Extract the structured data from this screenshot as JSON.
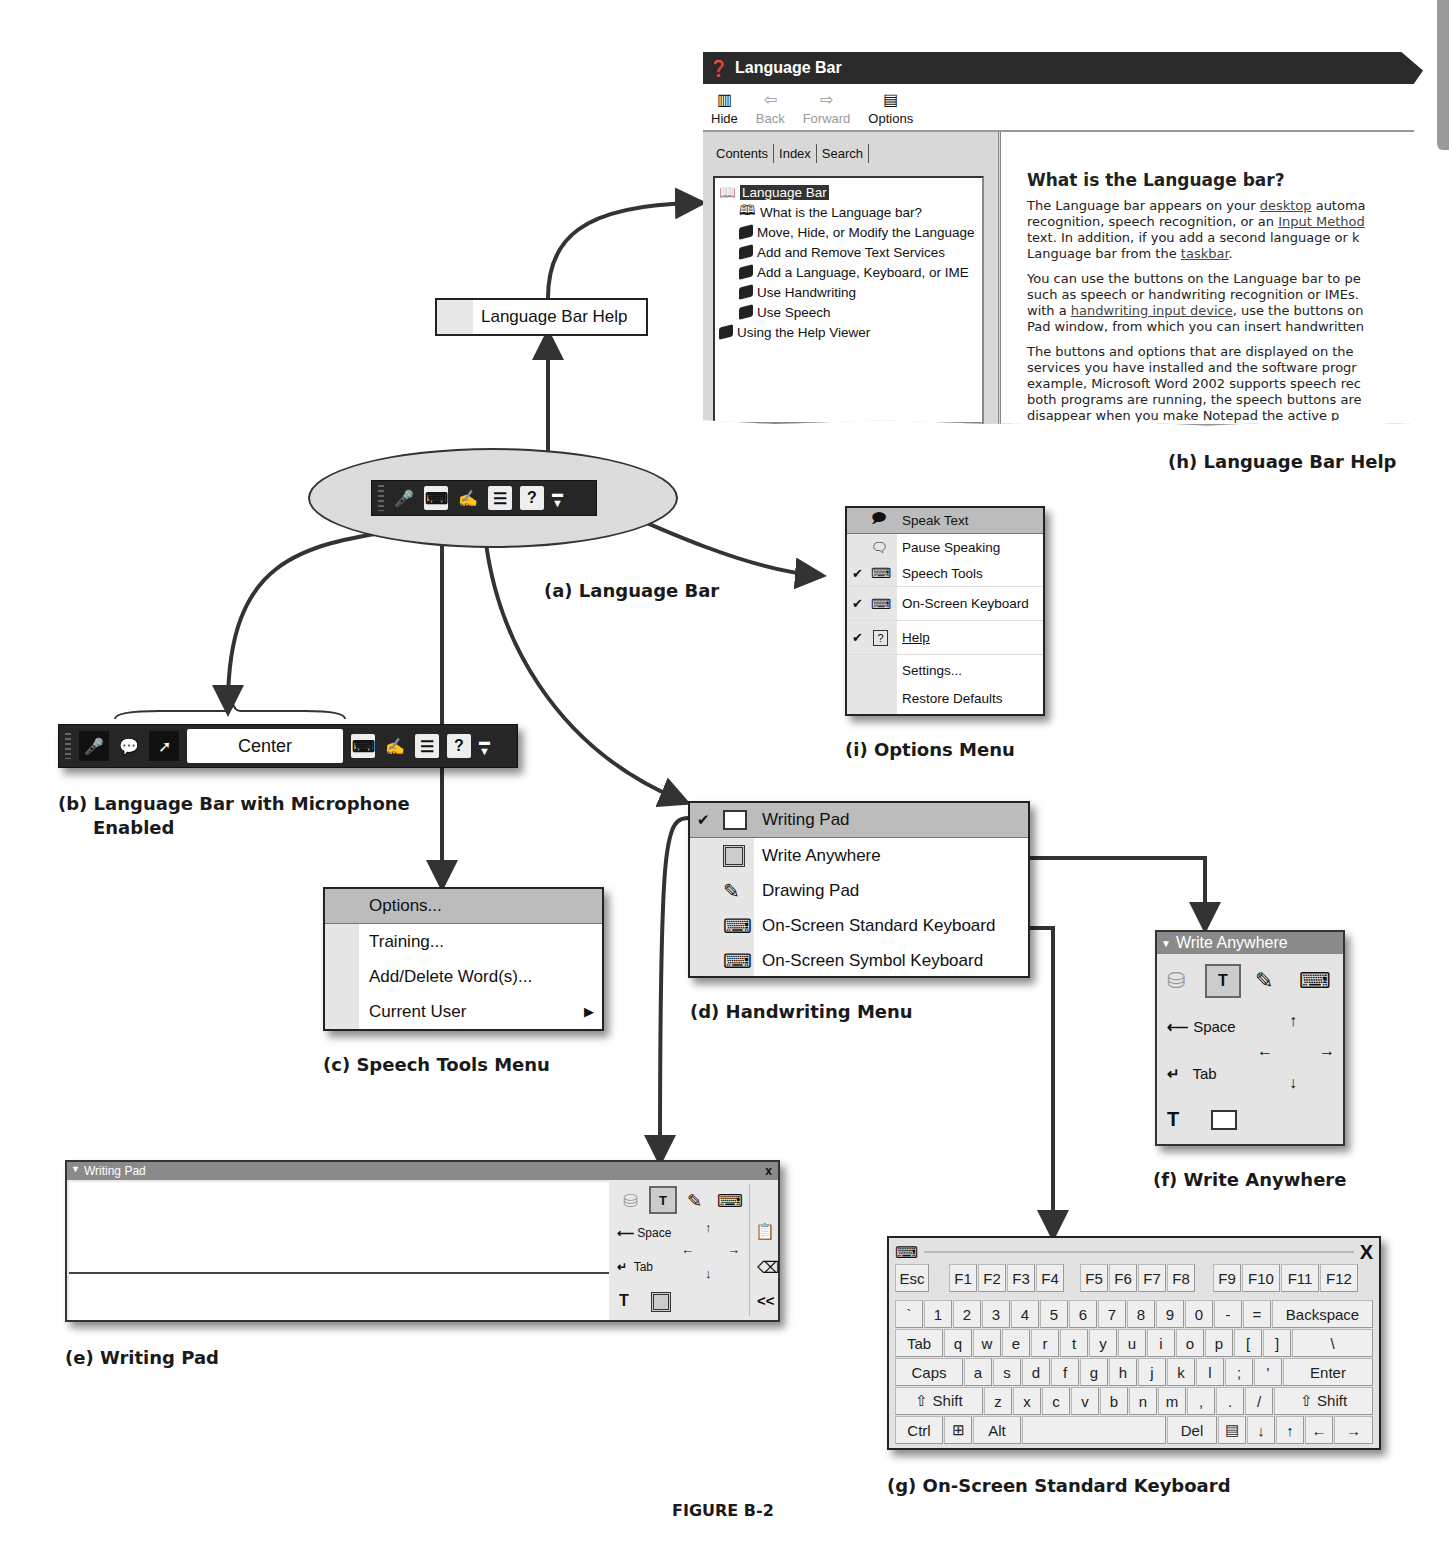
{
  "figure_label": "FIGURE B-2",
  "captions": {
    "a": "(a) Language Bar",
    "b_line1": "(b) Language Bar with Microphone",
    "b_line2": "Enabled",
    "c": "(c) Speech Tools Menu",
    "d": "(d) Handwriting Menu",
    "e": "(e) Writing Pad",
    "f": "(f) Write Anywhere",
    "g": "(g) On-Screen Standard Keyboard",
    "h": "(h) Language Bar Help",
    "i": "(i) Options Menu"
  },
  "help_window": {
    "title": "Language Bar",
    "toolbar": [
      {
        "label": "Hide",
        "icon": "hide-icon",
        "enabled": true
      },
      {
        "label": "Back",
        "icon": "back-arrow-icon",
        "enabled": false
      },
      {
        "label": "Forward",
        "icon": "forward-arrow-icon",
        "enabled": false
      },
      {
        "label": "Options",
        "icon": "options-icon",
        "enabled": true
      }
    ],
    "tabs": [
      "Contents",
      "Index",
      "Search"
    ],
    "tree": [
      {
        "label": "Language Bar",
        "level": 0,
        "selected": true,
        "icon": "open-book-icon"
      },
      {
        "label": "What is the Language bar?",
        "level": 1,
        "icon": "help-page-icon"
      },
      {
        "label": "Move, Hide, or Modify the Language",
        "level": 1,
        "icon": "book-icon"
      },
      {
        "label": "Add and Remove Text Services",
        "level": 1,
        "icon": "book-icon"
      },
      {
        "label": "Add a Language, Keyboard, or IME",
        "level": 1,
        "icon": "book-icon"
      },
      {
        "label": "Use Handwriting",
        "level": 1,
        "icon": "book-icon"
      },
      {
        "label": "Use Speech",
        "level": 1,
        "icon": "book-icon"
      },
      {
        "label": "Using the Help Viewer",
        "level": 0,
        "icon": "book-icon"
      }
    ],
    "content": {
      "heading": "What is the Language bar?",
      "p1": [
        "The Language bar appears on your ",
        "desktop",
        " automa",
        "recognition, speech recognition, or an ",
        "Input Method",
        "text. In addition, if you add a second language or k",
        "Language bar from the ",
        "taskbar",
        "."
      ],
      "p2": [
        "You can use the buttons on the Language bar to pe",
        "such as speech or handwriting recognition or IMEs.",
        "with a ",
        "handwriting input device",
        ", use the buttons on",
        "Pad window, from which you can insert handwritten"
      ],
      "p3": [
        "The buttons and options that are displayed on the",
        "services you have installed and the software progr",
        "example, Microsoft Word 2002 supports speech rec",
        "both programs are running, the speech buttons are",
        "disappear when you make Notepad the active p"
      ]
    }
  },
  "language_bar_help_item": "Language Bar Help",
  "language_bar": {
    "icons": [
      "microphone-icon",
      "speech-tools-icon",
      "handwriting-icon",
      "writing-pad-icon",
      "help-icon",
      "minimize-icon"
    ]
  },
  "language_bar_mic": {
    "status_text": "Center",
    "icons": [
      "microphone-icon",
      "dictation-icon",
      "voice-command-icon",
      "speech-tools-icon",
      "handwriting-icon",
      "writing-pad-icon",
      "help-icon",
      "minimize-icon"
    ]
  },
  "options_menu": {
    "items": [
      {
        "label": "Speak Text",
        "checked": false,
        "highlighted": true,
        "icon": "speak-text-icon"
      },
      {
        "label": "Pause Speaking",
        "checked": false,
        "icon": "pause-speaking-icon"
      },
      {
        "label": "Speech Tools",
        "checked": true,
        "icon": "speech-tools-icon"
      },
      {
        "label": "On-Screen Keyboard",
        "checked": true,
        "icon": "keyboard-icon"
      },
      {
        "label": "Help",
        "checked": true,
        "icon": "help-icon"
      },
      {
        "label": "Settings...",
        "checked": false
      },
      {
        "label": "Restore Defaults",
        "checked": false
      }
    ]
  },
  "speech_tools_menu": {
    "items": [
      {
        "label": "Options...",
        "highlighted": true
      },
      {
        "label": "Training..."
      },
      {
        "label": "Add/Delete Word(s)..."
      },
      {
        "label": "Current User",
        "submenu": true
      }
    ]
  },
  "handwriting_menu": {
    "items": [
      {
        "label": "Writing Pad",
        "checked": true,
        "highlighted": true,
        "icon": "writing-pad-icon"
      },
      {
        "label": "Write Anywhere",
        "icon": "write-anywhere-icon"
      },
      {
        "label": "Drawing Pad",
        "icon": "drawing-pad-icon"
      },
      {
        "label": "On-Screen Standard Keyboard",
        "icon": "keyboard-icon"
      },
      {
        "label": "On-Screen Symbol Keyboard",
        "icon": "keyboard-icon"
      }
    ]
  },
  "write_anywhere": {
    "title": "Write Anywhere",
    "space_label": "Space",
    "tab_label": "Tab"
  },
  "writing_pad": {
    "title": "Writing Pad",
    "close": "x",
    "space_label": "Space",
    "tab_label": "Tab",
    "collapse": "<<"
  },
  "keyboard": {
    "close": "X",
    "rows": [
      [
        "Esc",
        "",
        "F1",
        "F2",
        "F3",
        "F4",
        "",
        "F5",
        "F6",
        "F7",
        "F8",
        "",
        "F9",
        "F10",
        "F11",
        "F12"
      ],
      [
        "`",
        "1",
        "2",
        "3",
        "4",
        "5",
        "6",
        "7",
        "8",
        "9",
        "0",
        "-",
        "=",
        "Backspace"
      ],
      [
        "Tab",
        "q",
        "w",
        "e",
        "r",
        "t",
        "y",
        "u",
        "i",
        "o",
        "p",
        "[",
        "]",
        "\\"
      ],
      [
        "Caps",
        "a",
        "s",
        "d",
        "f",
        "g",
        "h",
        "j",
        "k",
        "l",
        ";",
        "'",
        "Enter"
      ],
      [
        "⇧ Shift",
        "z",
        "x",
        "c",
        "v",
        "b",
        "n",
        "m",
        ",",
        ".",
        "/",
        "⇧ Shift"
      ],
      [
        "Ctrl",
        "⊞",
        "Alt",
        " ",
        "Del",
        "▤",
        "↓",
        "↑",
        "←",
        "→"
      ]
    ]
  }
}
